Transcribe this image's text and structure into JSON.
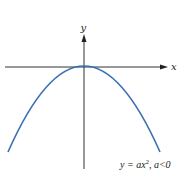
{
  "diagram": {
    "type": "parabola",
    "x_axis_label": "x",
    "y_axis_label": "y",
    "equation_prefix": "y = ax",
    "equation_exponent": "2",
    "equation_suffix": ", a<0",
    "curve_color": "#3a6fb5",
    "axis_color": "#333333"
  }
}
